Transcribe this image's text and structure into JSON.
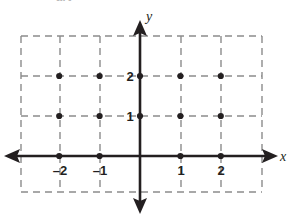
{
  "figure": {
    "title_clipped": "art",
    "background_color": "#ffffff"
  },
  "chart_data": {
    "type": "scatter",
    "title": "",
    "subtitle": "",
    "xlabel": "x",
    "ylabel": "y",
    "xlim": [
      -2.5,
      2.5
    ],
    "ylim": [
      -0.5,
      2.5
    ],
    "grid": true,
    "grid_style": "dashed",
    "grid_color": "#8c8c8c",
    "axis_color": "#231f20",
    "point_color": "#231f20",
    "legend": "none",
    "xticks": [
      -2,
      -1,
      1,
      2
    ],
    "xtick_labels": [
      "–2",
      "–1",
      "1",
      "2"
    ],
    "yticks": [
      1,
      2
    ],
    "ytick_labels": [
      "1",
      "2"
    ],
    "x_axis_arrows": [
      "left",
      "right"
    ],
    "y_axis_arrows": [
      "up",
      "down"
    ],
    "points": [
      {
        "x": -2,
        "y": 0
      },
      {
        "x": -1,
        "y": 0
      },
      {
        "x": 1,
        "y": 0
      },
      {
        "x": 2,
        "y": 0
      },
      {
        "x": -2,
        "y": 1
      },
      {
        "x": -1,
        "y": 1
      },
      {
        "x": 0,
        "y": 1
      },
      {
        "x": 1,
        "y": 1
      },
      {
        "x": 2,
        "y": 1
      },
      {
        "x": -2,
        "y": 2
      },
      {
        "x": -1,
        "y": 2
      },
      {
        "x": 0,
        "y": 2
      },
      {
        "x": 1,
        "y": 2
      },
      {
        "x": 2,
        "y": 2
      }
    ],
    "point_count": 14,
    "origin_plotted": false
  },
  "axis_labels": {
    "x": "x",
    "y": "y"
  },
  "tick_text": {
    "x_neg2": "–2",
    "x_neg1": "–1",
    "x_pos1": "1",
    "x_pos2": "2",
    "y_pos1": "1",
    "y_pos2": "2"
  }
}
